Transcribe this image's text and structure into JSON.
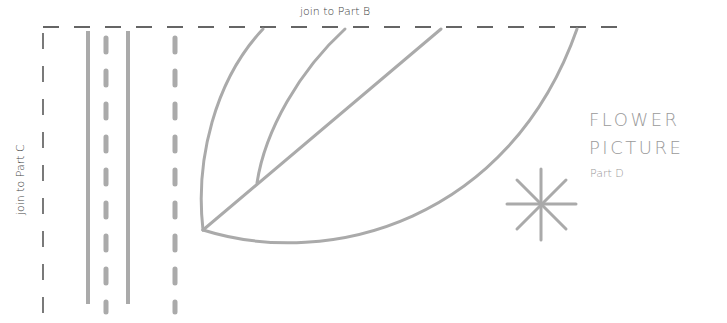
{
  "labels": {
    "join_top": "join to Part B",
    "join_left": "join to Part C",
    "title_line1": "FLOWER",
    "title_line2": "PICTURE",
    "subtitle": "Part D"
  },
  "colors": {
    "cut_line": "#333333",
    "stitch_line": "#aaaaaa",
    "title_text": "#9a9a9a"
  }
}
